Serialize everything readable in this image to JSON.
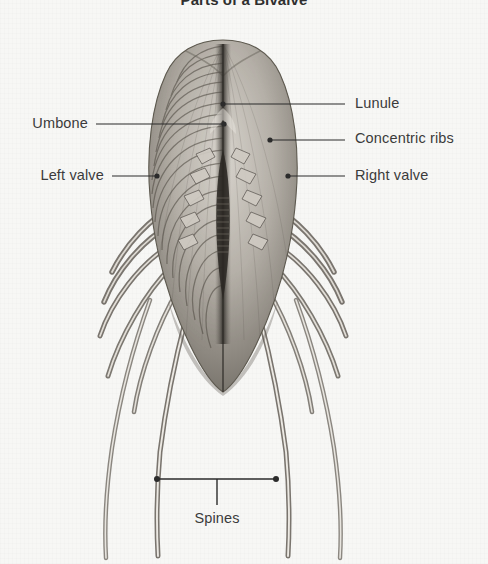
{
  "page": {
    "title": "Parts of a Bivalve",
    "background_color": "#f7f7f5",
    "text_color": "#3b3b3b",
    "leader_color": "#2b2b2b",
    "width": 488,
    "height": 564
  },
  "figure": {
    "style": "engraving",
    "ink_color": "#4a4a4a"
  },
  "labels": [
    {
      "id": "lunule",
      "text": "Lunule",
      "side": "right",
      "text_x": 355,
      "text_y": 105,
      "line_x1": 345,
      "line_x2": 224,
      "line_y": 104,
      "dot_x": 223,
      "dot_y": 104
    },
    {
      "id": "umbone",
      "text": "Umbone",
      "side": "left",
      "text_x": 88,
      "text_y": 125,
      "line_x1": 96,
      "line_x2": 224,
      "line_y": 124,
      "dot_x": 224,
      "dot_y": 124
    },
    {
      "id": "concentric-ribs",
      "text": "Concentric ribs",
      "side": "right",
      "text_x": 355,
      "text_y": 140,
      "line_x1": 345,
      "line_x2": 271,
      "line_y": 140,
      "dot_x": 270,
      "dot_y": 140
    },
    {
      "id": "left-valve",
      "text": "Left valve",
      "side": "left",
      "text_x": 104,
      "text_y": 177,
      "line_x1": 112,
      "line_x2": 157,
      "line_y": 176,
      "dot_x": 157,
      "dot_y": 176
    },
    {
      "id": "right-valve",
      "text": "Right valve",
      "side": "right",
      "text_x": 355,
      "text_y": 177,
      "line_x1": 345,
      "line_x2": 289,
      "line_y": 176,
      "dot_x": 288,
      "dot_y": 176
    }
  ],
  "bracket": {
    "id": "spines",
    "text": "Spines",
    "text_x": 217,
    "text_y": 524,
    "x1": 157,
    "x2": 276,
    "y": 479,
    "stem_x": 217,
    "stem_y2": 505
  }
}
